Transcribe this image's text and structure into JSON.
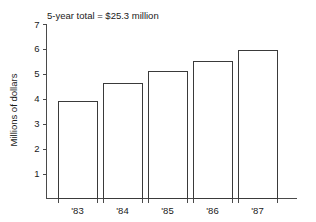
{
  "chart_data": {
    "type": "bar",
    "title": "5-year total = $25.3 million",
    "xlabel": "",
    "ylabel": "Millions of dollars",
    "categories": [
      "'83",
      "'84",
      "'85",
      "'86",
      "'87"
    ],
    "values": [
      3.9,
      4.65,
      5.1,
      5.5,
      5.95
    ],
    "ylim": [
      0,
      7
    ],
    "yticks": [
      1,
      2,
      3,
      4,
      5,
      6,
      7
    ],
    "ytick_labels": [
      "1",
      "2",
      "3",
      "4",
      "5",
      "6",
      "7"
    ],
    "grid": false,
    "legend": null,
    "bar_fill_color": "#ffffff",
    "bar_edge_color": "#3a3a3a",
    "axis_color": "#4a4a4a",
    "text_color": "#1a1a1a",
    "background_color": "#ffffff"
  }
}
